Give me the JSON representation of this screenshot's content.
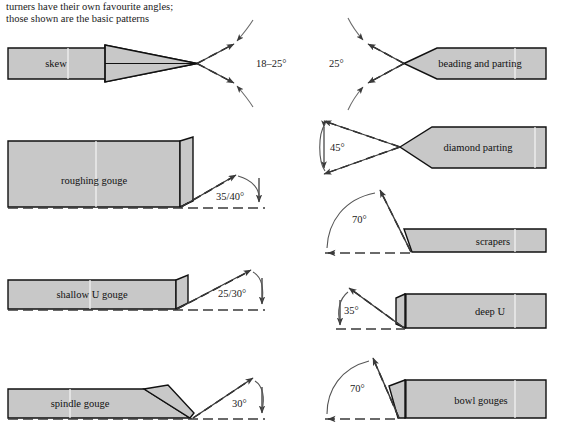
{
  "caption": {
    "line1": "turners have their own favourite angles;",
    "line2": "those shown are the basic patterns",
    "text": "turners have their own favourite angles;\nthose shown are the basic patterns"
  },
  "colors": {
    "tool_fill": "#c8c8c8",
    "tool_outline": "#111111",
    "dash_line": "#111111",
    "arrow": "#3a3a3a",
    "text": "#1a1a1a",
    "background": "#ffffff"
  },
  "diagram": {
    "title_semantic": "woodturning-tool-grinding-angles",
    "columns": 2,
    "rows": 5
  },
  "tools": [
    {
      "id": "skew",
      "label": "skew",
      "column": "left",
      "row": 1,
      "angle": "18–25°",
      "angle_value_min": 18,
      "angle_value_max": 25,
      "point_direction": "right",
      "profile": "double-bevel-point"
    },
    {
      "id": "beading-and-parting",
      "label": "beading and parting",
      "column": "right",
      "row": 1,
      "angle": "25°",
      "angle_value_min": 25,
      "angle_value_max": 25,
      "point_direction": "left",
      "profile": "double-bevel-point"
    },
    {
      "id": "roughing-gouge",
      "label": "roughing gouge",
      "column": "left",
      "row": 2,
      "angle": "35/40°",
      "angle_value_min": 35,
      "angle_value_max": 40,
      "point_direction": "right",
      "profile": "square-end-deep"
    },
    {
      "id": "diamond-parting",
      "label": "diamond parting",
      "column": "right",
      "row": 2,
      "angle": "45°",
      "angle_value_min": 45,
      "angle_value_max": 45,
      "point_direction": "left",
      "profile": "double-bevel-point"
    },
    {
      "id": "scrapers",
      "label": "scrapers",
      "column": "right",
      "row": 3,
      "angle": "70°",
      "angle_value_min": 70,
      "angle_value_max": 70,
      "point_direction": "left",
      "profile": "single-bevel-flat"
    },
    {
      "id": "shallow-u-gouge",
      "label": "shallow U gouge",
      "column": "left",
      "row": 3,
      "angle": "25/30°",
      "angle_value_min": 25,
      "angle_value_max": 30,
      "point_direction": "right",
      "profile": "square-end-shallow"
    },
    {
      "id": "deep-u",
      "label": "deep U",
      "column": "right",
      "row": 4,
      "angle": "35°",
      "angle_value_min": 35,
      "angle_value_max": 35,
      "point_direction": "left",
      "profile": "square-end-deep"
    },
    {
      "id": "spindle-gouge",
      "label": "spindle gouge",
      "column": "left",
      "row": 4,
      "angle": "30°",
      "angle_value_min": 30,
      "angle_value_max": 30,
      "point_direction": "right",
      "profile": "long-bevel"
    },
    {
      "id": "bowl-gouges",
      "label": "bowl gouges",
      "column": "right",
      "row": 5,
      "angle": "70°",
      "angle_value_min": 70,
      "angle_value_max": 70,
      "point_direction": "left",
      "profile": "steep-bevel"
    }
  ]
}
